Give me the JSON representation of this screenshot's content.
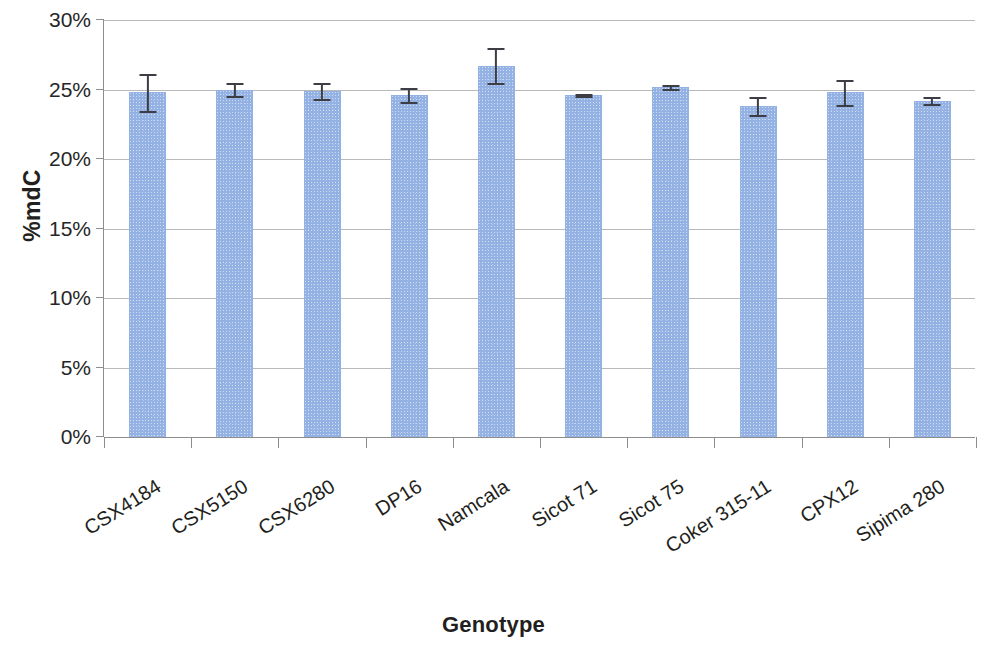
{
  "chart_data": {
    "type": "bar",
    "title": "",
    "xlabel": "Genotype",
    "ylabel": "%mdC",
    "categories": [
      "CSX4184",
      "CSX5150",
      "CSX6280",
      "DP16",
      "Namcala",
      "Sicot 71",
      "Sicot 75",
      "Coker 315-11",
      "CPX12",
      "Sipima 280"
    ],
    "values": [
      24.8,
      25.0,
      24.9,
      24.6,
      26.7,
      24.6,
      25.2,
      23.8,
      24.8,
      24.2
    ],
    "errors": [
      1.35,
      0.45,
      0.6,
      0.5,
      1.25,
      0.1,
      0.15,
      0.65,
      0.9,
      0.25
    ],
    "ylim": [
      0,
      30
    ],
    "ytick_labels": [
      "0%",
      "5%",
      "10%",
      "15%",
      "20%",
      "25%",
      "30%"
    ],
    "ytick_values": [
      0,
      5,
      10,
      15,
      20,
      25,
      30
    ],
    "grid": true,
    "legend": "none",
    "bar_color": "#93b2e3",
    "error_bar_color": "#3d3d46",
    "axis_color": "#8d8d8d",
    "gridline_color": "#b9b9b9"
  }
}
